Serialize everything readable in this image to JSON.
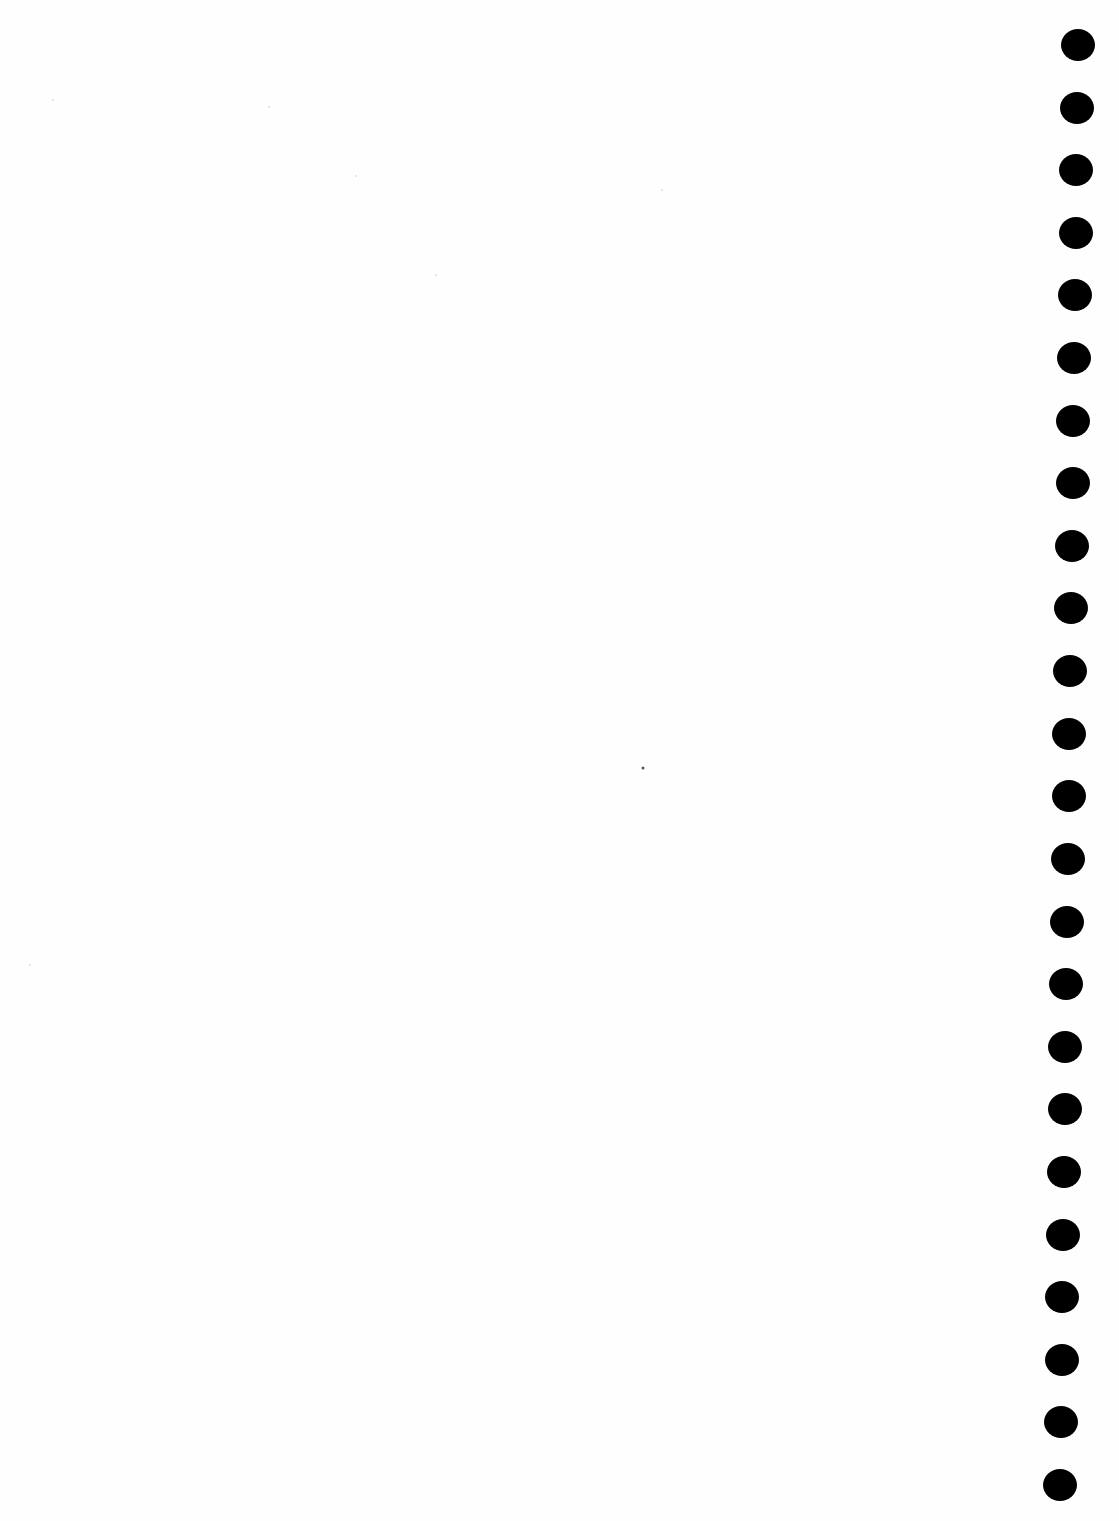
{
  "page": {
    "type": "blank scanned page with binder punch holes",
    "background_color": "#fefefe",
    "hole_color": "#000000",
    "text": ""
  },
  "punch_holes": {
    "count": 24,
    "first_center": [
      1078,
      45
    ],
    "last_center": [
      1060,
      1485
    ],
    "diameter": 34
  },
  "specks": [
    {
      "x": 643,
      "y": 768,
      "strong": true
    },
    {
      "x": 53,
      "y": 100,
      "strong": false
    },
    {
      "x": 269,
      "y": 107,
      "strong": false
    },
    {
      "x": 356,
      "y": 176,
      "strong": false
    },
    {
      "x": 436,
      "y": 275,
      "strong": false
    },
    {
      "x": 662,
      "y": 190,
      "strong": false
    },
    {
      "x": 30,
      "y": 965,
      "strong": false
    }
  ]
}
